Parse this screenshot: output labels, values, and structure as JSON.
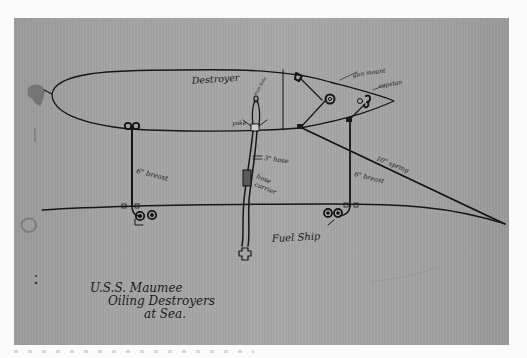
{
  "document": {
    "type": "hand-drawn pen sketch on paper (scanned photograph)",
    "caption": {
      "line1": "U.S.S. Maumee",
      "line2": "Oiling Destroyers",
      "line3": "at Sea."
    }
  },
  "diagram": {
    "ships": {
      "destroyer": "Destroyer",
      "fuel_ship": "Fuel Ship"
    },
    "labels": {
      "gun_mount": "gun mount",
      "capstan": "capstan",
      "yoke": "yoke",
      "man_hole": "man hole",
      "hose": "3\" hose",
      "hose_carrier_1": "hose",
      "hose_carrier_2": "carrier",
      "breast_aft": "6\" breast",
      "breast_fwd": "6\" breast",
      "spring": "10\" spring"
    }
  },
  "colors": {
    "paper": "#a5a5a5",
    "ink": "#161616",
    "background": "#fbfbfb"
  }
}
